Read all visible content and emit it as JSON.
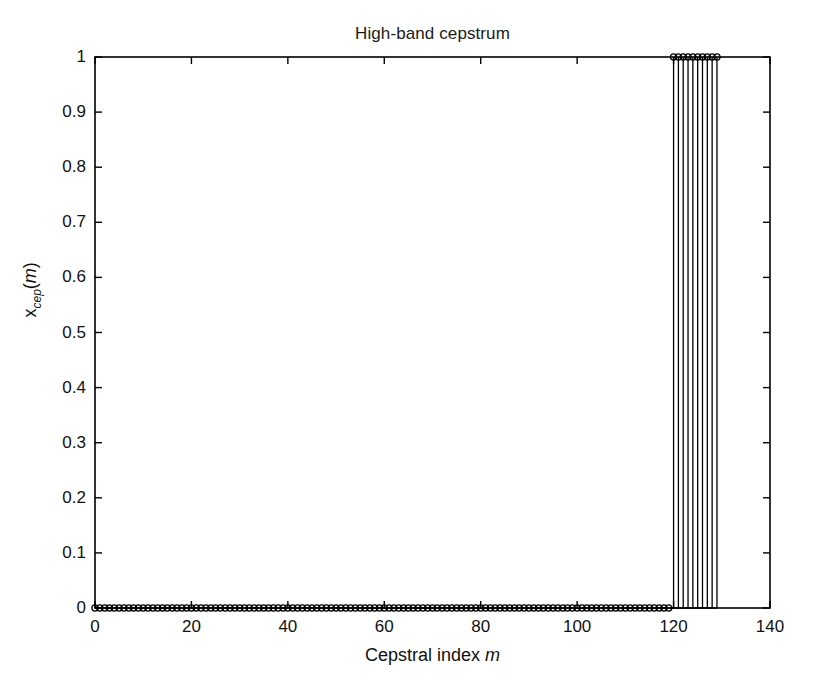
{
  "figure": {
    "title": "High-band cepstrum",
    "background_color": "#ffffff",
    "axis_color": "#000000",
    "data_color": "#000000"
  },
  "axes": {
    "xlabel_prefix": "Cepstral index ",
    "xlabel_var": "m",
    "ylabel_base": "x",
    "ylabel_sub": "cep",
    "ylabel_open": "(",
    "ylabel_var": "m",
    "ylabel_close": ")",
    "x_ticks": [
      "0",
      "20",
      "40",
      "60",
      "80",
      "100",
      "120",
      "140"
    ],
    "y_ticks": [
      "0",
      "0.1",
      "0.2",
      "0.3",
      "0.4",
      "0.5",
      "0.6",
      "0.7",
      "0.8",
      "0.9",
      "1"
    ]
  },
  "chart_data": {
    "type": "line",
    "plot_style": "stem",
    "title": "High-band cepstrum",
    "xlabel": "Cepstral index m",
    "ylabel": "x_cep(m)",
    "xlim": [
      0,
      140
    ],
    "ylim": [
      0,
      1
    ],
    "xticks": [
      0,
      20,
      40,
      60,
      80,
      100,
      120,
      140
    ],
    "yticks": [
      0,
      0.1,
      0.2,
      0.3,
      0.4,
      0.5,
      0.6,
      0.7,
      0.8,
      0.9,
      1
    ],
    "grid": false,
    "legend": "none",
    "marker": "circle-open",
    "series": [
      {
        "name": "x_cep(m)",
        "x": [
          0,
          1,
          2,
          3,
          4,
          5,
          6,
          7,
          8,
          9,
          10,
          11,
          12,
          13,
          14,
          15,
          16,
          17,
          18,
          19,
          20,
          21,
          22,
          23,
          24,
          25,
          26,
          27,
          28,
          29,
          30,
          31,
          32,
          33,
          34,
          35,
          36,
          37,
          38,
          39,
          40,
          41,
          42,
          43,
          44,
          45,
          46,
          47,
          48,
          49,
          50,
          51,
          52,
          53,
          54,
          55,
          56,
          57,
          58,
          59,
          60,
          61,
          62,
          63,
          64,
          65,
          66,
          67,
          68,
          69,
          70,
          71,
          72,
          73,
          74,
          75,
          76,
          77,
          78,
          79,
          80,
          81,
          82,
          83,
          84,
          85,
          86,
          87,
          88,
          89,
          90,
          91,
          92,
          93,
          94,
          95,
          96,
          97,
          98,
          99,
          100,
          101,
          102,
          103,
          104,
          105,
          106,
          107,
          108,
          109,
          110,
          111,
          112,
          113,
          114,
          115,
          116,
          117,
          118,
          119,
          120,
          121,
          122,
          123,
          124,
          125,
          126,
          127,
          128,
          129
        ],
        "values": [
          0,
          0,
          0,
          0,
          0,
          0,
          0,
          0,
          0,
          0,
          0,
          0,
          0,
          0,
          0,
          0,
          0,
          0,
          0,
          0,
          0,
          0,
          0,
          0,
          0,
          0,
          0,
          0,
          0,
          0,
          0,
          0,
          0,
          0,
          0,
          0,
          0,
          0,
          0,
          0,
          0,
          0,
          0,
          0,
          0,
          0,
          0,
          0,
          0,
          0,
          0,
          0,
          0,
          0,
          0,
          0,
          0,
          0,
          0,
          0,
          0,
          0,
          0,
          0,
          0,
          0,
          0,
          0,
          0,
          0,
          0,
          0,
          0,
          0,
          0,
          0,
          0,
          0,
          0,
          0,
          0,
          0,
          0,
          0,
          0,
          0,
          0,
          0,
          0,
          0,
          0,
          0,
          0,
          0,
          0,
          0,
          0,
          0,
          0,
          0,
          0,
          0,
          0,
          0,
          0,
          0,
          0,
          0,
          0,
          0,
          0,
          0,
          0,
          0,
          0,
          0,
          0,
          0,
          0,
          0,
          1,
          1,
          1,
          1,
          1,
          1,
          1,
          1,
          1,
          1
        ]
      }
    ]
  }
}
